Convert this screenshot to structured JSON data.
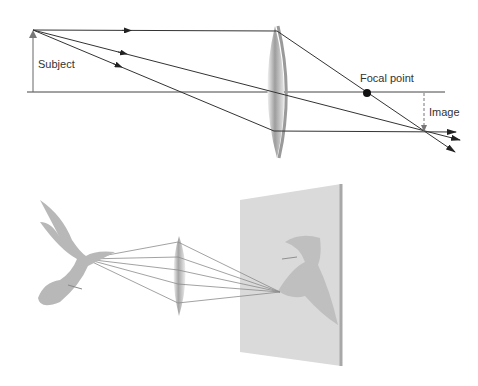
{
  "diagram": {
    "top": {
      "labels": {
        "subject": "Subject",
        "focal_point": "Focal point",
        "image": "Image"
      },
      "colors": {
        "ray": "#333333",
        "lens_edge": "#9a9a9a",
        "lens_fill": "#d8d8d8",
        "focal_dot": "#111111"
      }
    },
    "bottom": {
      "description": "Bird projected through a convex lens onto a screen as an inverted image",
      "colors": {
        "screen": "#d9d9d9",
        "screen_edge": "#a8a8a8",
        "bird": "#b8b8b8",
        "ray": "#8a8a8a"
      }
    }
  }
}
